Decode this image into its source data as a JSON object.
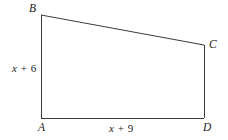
{
  "figure": {
    "kind": "geometry-diagram",
    "shape_name": "trapezoid ABCD",
    "background_color": "#ffffff",
    "stroke_color": "#3a3a3a",
    "text_color": "#222222",
    "vertices": [
      {
        "id": "B",
        "label": "B",
        "x": 41,
        "y": 15
      },
      {
        "id": "C",
        "label": "C",
        "x": 204,
        "y": 45
      },
      {
        "id": "D",
        "label": "D",
        "x": 204,
        "y": 118
      },
      {
        "id": "A",
        "label": "A",
        "x": 41,
        "y": 118
      }
    ],
    "edges": [
      {
        "id": "BC",
        "from": "B",
        "to": "C",
        "label": ""
      },
      {
        "id": "CD",
        "from": "C",
        "to": "D",
        "label": ""
      },
      {
        "id": "DA",
        "from": "D",
        "to": "A",
        "label": "x + 9"
      },
      {
        "id": "AB",
        "from": "A",
        "to": "B",
        "label": "x + 6"
      }
    ],
    "side_labels": {
      "left": {
        "variable": "x",
        "operator": "+",
        "number": "6",
        "full": "x + 6"
      },
      "bottom": {
        "variable": "x",
        "operator": "+",
        "number": "9",
        "full": "x + 9"
      }
    }
  }
}
